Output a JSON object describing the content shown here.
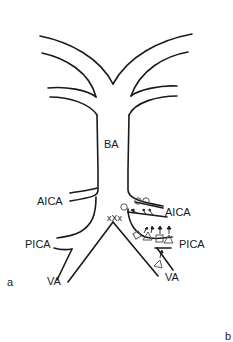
{
  "figure": {
    "panel_labels": {
      "a": "a",
      "b": "b"
    },
    "vessels": {
      "basilar": "BA",
      "left_aica": "AICA",
      "right_aica": "AICA",
      "left_pica": "PICA",
      "right_pica": "PICA",
      "left_va": "VA",
      "right_va": "VA"
    },
    "marker_text": "xXx",
    "legend_symbols": [
      "circle",
      "square",
      "triangle",
      "arrow"
    ],
    "line_color": "#1a1a1a",
    "background": "#ffffff"
  }
}
